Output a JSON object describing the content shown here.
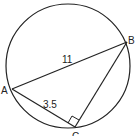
{
  "diagram": {
    "type": "inscribed-triangle-in-circle",
    "circle": {
      "cx": 68,
      "cy": 66,
      "r": 62
    },
    "points": {
      "A": {
        "label": "A",
        "x": 12,
        "y": 89
      },
      "B": {
        "label": "B",
        "x": 127,
        "y": 42
      },
      "C": {
        "label": "C",
        "x": 75,
        "y": 127
      }
    },
    "segments": {
      "AB": {
        "label": "11"
      },
      "AC": {
        "label": "3.5"
      },
      "BC": {
        "label": ""
      }
    },
    "right_angle_at": "C",
    "stroke_color": "#222222"
  }
}
